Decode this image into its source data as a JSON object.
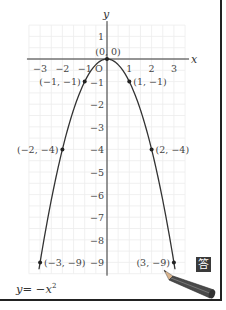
{
  "chart_data": {
    "type": "line",
    "title": "",
    "equation_label": "y = −x²",
    "equation_parts": {
      "lhs": "y",
      "eq": "= −",
      "var": "x",
      "exp": "2"
    },
    "xlabel": "x",
    "ylabel": "y",
    "origin_label": "O",
    "xlim": [
      -3.5,
      3.5
    ],
    "ylim": [
      -9.5,
      1.5
    ],
    "grid": true,
    "grid_step": 0.5,
    "x_ticks": [
      {
        "value": -3,
        "label": "−3"
      },
      {
        "value": -2,
        "label": "−2"
      },
      {
        "value": -1,
        "label": "−1"
      },
      {
        "value": 1,
        "label": "1"
      },
      {
        "value": 2,
        "label": "2"
      },
      {
        "value": 3,
        "label": "3"
      }
    ],
    "y_ticks": [
      {
        "value": 1,
        "label": "1"
      },
      {
        "value": -1,
        "label": "−1"
      },
      {
        "value": -2,
        "label": "−2"
      },
      {
        "value": -3,
        "label": "−3"
      },
      {
        "value": -4,
        "label": "−4"
      },
      {
        "value": -5,
        "label": "−5"
      },
      {
        "value": -6,
        "label": "−6"
      },
      {
        "value": -7,
        "label": "−7"
      },
      {
        "value": -8,
        "label": "−8"
      },
      {
        "value": -9,
        "label": "−9"
      }
    ],
    "series": [
      {
        "name": "y = -x^2",
        "function": "-x^2",
        "x_range": [
          -3.05,
          3.05
        ],
        "color": "#333333"
      }
    ],
    "points": [
      {
        "x": 0,
        "y": 0,
        "label": "(0,  0)",
        "label_side": "top"
      },
      {
        "x": -1,
        "y": -1,
        "label": "(−1, −1)",
        "label_side": "left"
      },
      {
        "x": 1,
        "y": -1,
        "label": "(1, −1)",
        "label_side": "right"
      },
      {
        "x": -2,
        "y": -4,
        "label": "(−2, −4)",
        "label_side": "left"
      },
      {
        "x": 2,
        "y": -4,
        "label": "(2, −4)",
        "label_side": "right"
      },
      {
        "x": -3,
        "y": -9,
        "label": "(−3, −9)",
        "label_side": "right"
      },
      {
        "x": 3,
        "y": -9,
        "label": "(3, −9)",
        "label_side": "left"
      }
    ]
  },
  "badge": {
    "label": "答",
    "color": "#3a3a3a"
  },
  "pencil_icon": "pencil-icon"
}
